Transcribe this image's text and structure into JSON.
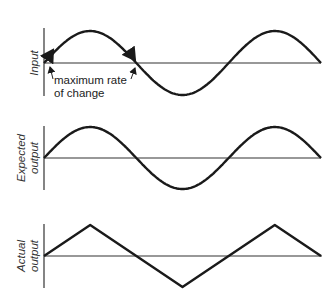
{
  "panels": [
    {
      "id": "input",
      "label_lines": [
        "Input"
      ],
      "waveform": "sine"
    },
    {
      "id": "expected",
      "label_lines": [
        "Expected",
        "output"
      ],
      "waveform": "sine"
    },
    {
      "id": "actual",
      "label_lines": [
        "Actual",
        "output"
      ],
      "waveform": "triangle"
    }
  ],
  "annotation": {
    "lines": [
      "maximum rate",
      "of change"
    ]
  },
  "cycles": 1.5,
  "colors": {
    "curve": "#1a1a1a",
    "axis": "#333333",
    "text": "#333333"
  }
}
